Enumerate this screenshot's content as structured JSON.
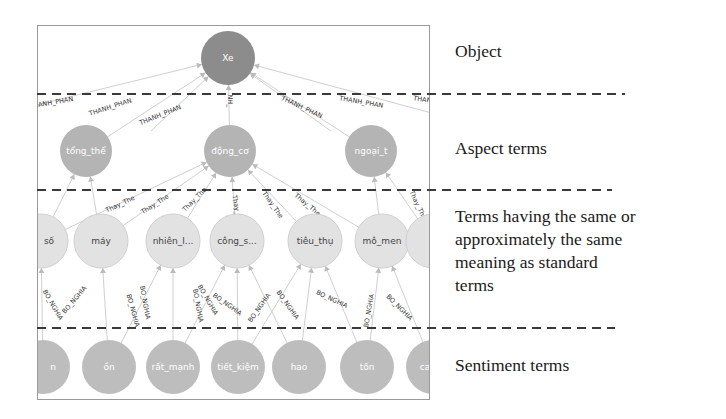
{
  "layers": [
    {
      "id": "object",
      "label": "Object",
      "label_lines": [
        "Object"
      ]
    },
    {
      "id": "aspect",
      "label": "Aspect terms",
      "label_lines": [
        "Aspect terms"
      ]
    },
    {
      "id": "synonym",
      "label": "Terms having the same or approximately the same meaning as standard terms",
      "label_lines": [
        "Terms having the same or",
        "approximately the same",
        "meaning as standard",
        "terms"
      ]
    },
    {
      "id": "sentiment",
      "label": "Sentiment terms",
      "label_lines": [
        "Sentiment terms"
      ]
    }
  ],
  "nodes": {
    "object": [
      {
        "label": "Xe"
      }
    ],
    "aspect": [
      {
        "label": "tổng_thể"
      },
      {
        "label": "động_cơ"
      },
      {
        "label": "ngoại_t"
      }
    ],
    "synonym": [
      {
        "label": "số"
      },
      {
        "label": "máy"
      },
      {
        "label": "nhiên_l..."
      },
      {
        "label": "công_s..."
      },
      {
        "label": "tiêu_thụ"
      },
      {
        "label": "mô_men"
      },
      {
        "label": ""
      }
    ],
    "sentiment": [
      {
        "label": "n"
      },
      {
        "label": "ồn"
      },
      {
        "label": "rất_mạnh"
      },
      {
        "label": "tiết_kiệm"
      },
      {
        "label": "hao"
      },
      {
        "label": "tốn"
      },
      {
        "label": "ca"
      }
    ]
  },
  "edge_labels": {
    "object_aspect": "THANH_PHAN",
    "aspect_synonym": "Thay_The",
    "synonym_sentiment": "BO_NGHIA"
  },
  "colors": {
    "object_node": "#8c8c8c",
    "aspect_node": "#b4b4b4",
    "synonym_node": "#e2e2e2",
    "sentiment_node": "#bdbdbd",
    "edge": "#cfcfcf",
    "divider": "#3a3a3a",
    "frame": "#9a9a9a"
  }
}
